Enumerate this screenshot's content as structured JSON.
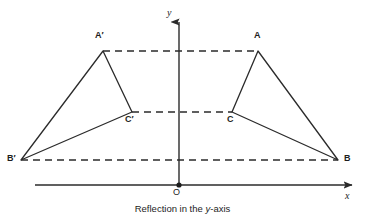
{
  "figure": {
    "caption_prefix": "Reflection in the ",
    "caption_emphasis": "y",
    "caption_suffix": "-axis",
    "caption_full": "Reflection in the y-axis",
    "stroke_color": "#2b2b2b",
    "background_color": "#ffffff",
    "text_color": "#1d1d1d"
  },
  "axes": {
    "y_axis_label": "y",
    "x_axis_label": "x",
    "origin_label": "O",
    "origin": {
      "x": 179,
      "y": 185
    },
    "x_axis": {
      "x1": 35,
      "y1": 185,
      "x2": 355,
      "y2": 185
    },
    "y_axis": {
      "x1": 179,
      "y1": 185,
      "x2": 179,
      "y2": 18
    }
  },
  "vertices": {
    "A": {
      "label": "A",
      "x": 258,
      "y": 51,
      "label_x": 254,
      "label_y": 35
    },
    "B": {
      "label": "B",
      "x": 338,
      "y": 160,
      "label_x": 344,
      "label_y": 158
    },
    "C": {
      "label": "C",
      "x": 232,
      "y": 112,
      "label_x": 228,
      "label_y": 119
    },
    "Aprime": {
      "label": "A′",
      "x": 103,
      "y": 51,
      "label_x": 95,
      "label_y": 35
    },
    "Bprime": {
      "label": "B′",
      "x": 21,
      "y": 160,
      "label_x": 8,
      "label_y": 158
    },
    "Cprime": {
      "label": "C′",
      "x": 132,
      "y": 112,
      "label_x": 126,
      "label_y": 119
    }
  },
  "shapes": {
    "original_triangle": "Triangle ABC",
    "image_triangle": "Triangle A′B′C′",
    "original_points": "258,51 338,160 232,112",
    "image_points": "103,51 21,160 132,112"
  },
  "connectors": [
    {
      "name": "A-to-A-prime",
      "x1": 103,
      "y1": 51,
      "x2": 258,
      "y2": 51
    },
    {
      "name": "C-to-C-prime",
      "x1": 132,
      "y1": 112,
      "x2": 232,
      "y2": 112
    },
    {
      "name": "B-to-B-prime",
      "x1": 21,
      "y1": 160,
      "x2": 338,
      "y2": 160
    }
  ]
}
